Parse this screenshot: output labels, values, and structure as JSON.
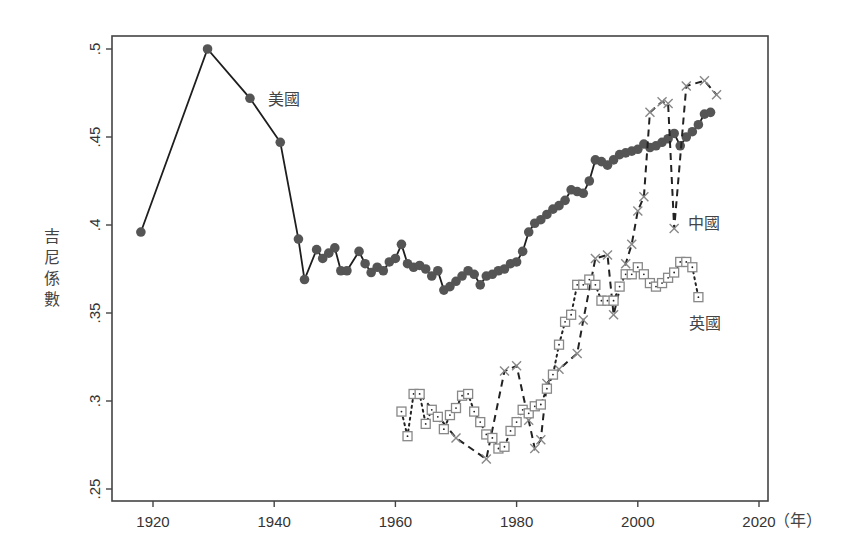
{
  "chart_data": {
    "type": "line",
    "title": "",
    "xlabel": "（年）",
    "ylabel": "吉尼係數",
    "xlim": [
      1913,
      2022
    ],
    "ylim": [
      0.243,
      0.507
    ],
    "x_ticks": [
      1920,
      1940,
      1960,
      1980,
      2000,
      2020
    ],
    "x_tick_labels": [
      "1920",
      "1940",
      "1960",
      "1980",
      "2000",
      "2020"
    ],
    "y_ticks": [
      0.25,
      0.3,
      0.35,
      0.4,
      0.45,
      0.5
    ],
    "y_tick_labels": [
      ".25",
      ".3",
      ".35",
      ".4",
      ".45",
      ".5"
    ],
    "grid": false,
    "legend": "none (inline labels)",
    "series": [
      {
        "name": "美國",
        "label": "美國",
        "marker": "filled-circle",
        "line": "solid",
        "color": "#555555",
        "x": [
          1918,
          1929,
          1936,
          1941,
          1944,
          1945,
          1947,
          1948,
          1949,
          1950,
          1951,
          1952,
          1954,
          1955,
          1956,
          1957,
          1958,
          1959,
          1960,
          1961,
          1962,
          1963,
          1964,
          1965,
          1966,
          1967,
          1968,
          1969,
          1970,
          1971,
          1972,
          1973,
          1974,
          1975,
          1976,
          1977,
          1978,
          1979,
          1980,
          1981,
          1982,
          1983,
          1984,
          1985,
          1986,
          1987,
          1988,
          1989,
          1990,
          1991,
          1992,
          1993,
          1994,
          1995,
          1996,
          1997,
          1998,
          1999,
          2000,
          2001,
          2002,
          2003,
          2004,
          2005,
          2006,
          2007,
          2008,
          2009,
          2010,
          2011,
          2012
        ],
        "y": [
          0.396,
          0.5,
          0.472,
          0.447,
          0.392,
          0.369,
          0.386,
          0.381,
          0.384,
          0.387,
          0.374,
          0.374,
          0.385,
          0.378,
          0.373,
          0.376,
          0.374,
          0.379,
          0.381,
          0.389,
          0.378,
          0.376,
          0.377,
          0.375,
          0.371,
          0.374,
          0.363,
          0.365,
          0.368,
          0.371,
          0.374,
          0.372,
          0.366,
          0.371,
          0.372,
          0.374,
          0.375,
          0.378,
          0.379,
          0.385,
          0.396,
          0.401,
          0.403,
          0.406,
          0.409,
          0.411,
          0.414,
          0.42,
          0.419,
          0.418,
          0.425,
          0.437,
          0.436,
          0.434,
          0.437,
          0.44,
          0.441,
          0.442,
          0.443,
          0.446,
          0.444,
          0.445,
          0.447,
          0.449,
          0.452,
          0.445,
          0.45,
          0.453,
          0.457,
          0.463,
          0.464
        ]
      },
      {
        "name": "中國",
        "label": "中國",
        "marker": "x",
        "line": "dashed",
        "color": "#888888",
        "x": [
          1964,
          1970,
          1975,
          1978,
          1980,
          1982,
          1983,
          1984,
          1985,
          1987,
          1990,
          1991,
          1993,
          1995,
          1996,
          1998,
          1999,
          2000,
          2001,
          2002,
          2004,
          2005,
          2006,
          2008,
          2011,
          2013
        ],
        "y": [
          0.304,
          0.279,
          0.267,
          0.317,
          0.32,
          0.289,
          0.273,
          0.278,
          0.31,
          0.318,
          0.327,
          0.346,
          0.381,
          0.383,
          0.349,
          0.378,
          0.389,
          0.408,
          0.416,
          0.464,
          0.47,
          0.469,
          0.398,
          0.479,
          0.482,
          0.474
        ]
      },
      {
        "name": "英國",
        "label": "英國",
        "marker": "hollow-square",
        "line": "dotted",
        "color": "#888888",
        "x": [
          1961,
          1962,
          1963,
          1964,
          1965,
          1966,
          1967,
          1968,
          1969,
          1970,
          1971,
          1972,
          1973,
          1974,
          1975,
          1976,
          1977,
          1978,
          1979,
          1980,
          1981,
          1982,
          1983,
          1984,
          1985,
          1986,
          1987,
          1988,
          1989,
          1990,
          1991,
          1992,
          1993,
          1994,
          1995,
          1996,
          1997,
          1998,
          1999,
          2000,
          2001,
          2002,
          2003,
          2004,
          2005,
          2006,
          2007,
          2008,
          2009,
          2010
        ],
        "y": [
          0.294,
          0.28,
          0.304,
          0.304,
          0.287,
          0.295,
          0.291,
          0.284,
          0.292,
          0.296,
          0.303,
          0.304,
          0.294,
          0.288,
          0.281,
          0.279,
          0.273,
          0.274,
          0.283,
          0.288,
          0.295,
          0.293,
          0.297,
          0.298,
          0.307,
          0.315,
          0.332,
          0.345,
          0.349,
          0.366,
          0.366,
          0.369,
          0.366,
          0.357,
          0.357,
          0.357,
          0.365,
          0.372,
          0.372,
          0.376,
          0.372,
          0.367,
          0.365,
          0.367,
          0.37,
          0.373,
          0.379,
          0.379,
          0.376,
          0.359
        ]
      }
    ],
    "annotations": [
      {
        "text": "美國",
        "series": "美國",
        "x": 1939,
        "y": 0.468
      },
      {
        "text": "中國",
        "series": "中國",
        "x": 2008.3,
        "y": 0.398
      },
      {
        "text": "英國",
        "series": "英國",
        "x": 2008.5,
        "y": 0.341
      }
    ]
  }
}
